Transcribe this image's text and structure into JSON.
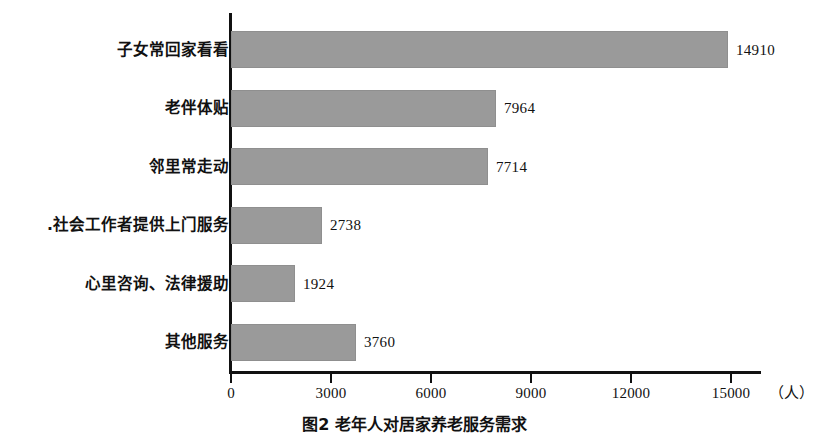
{
  "chart_data": {
    "type": "bar",
    "orientation": "horizontal",
    "title": "",
    "caption": "图2  老年人对居家养老服务需求",
    "xlabel": "（人）",
    "ylabel": "",
    "categories": [
      "子女常回家看看",
      "老伴体贴",
      "邻里常走动",
      ".社会工作者提供上门服务",
      "心里咨询、法律援助",
      "其他服务"
    ],
    "values": [
      14910,
      7964,
      7714,
      2738,
      1924,
      3760
    ],
    "value_labels": [
      "14910",
      "7964",
      "7714",
      "2738",
      "1924",
      "3760"
    ],
    "xlim": [
      0,
      15900
    ],
    "xticks": [
      0,
      3000,
      6000,
      9000,
      12000,
      15000
    ],
    "xtick_labels": [
      "0",
      "3000",
      "6000",
      "9000",
      "12000",
      "15000"
    ],
    "unit_label": "（人）",
    "grid": false,
    "legend": false,
    "bar_color": "#9a9a9a",
    "axis_color": "#111111"
  }
}
